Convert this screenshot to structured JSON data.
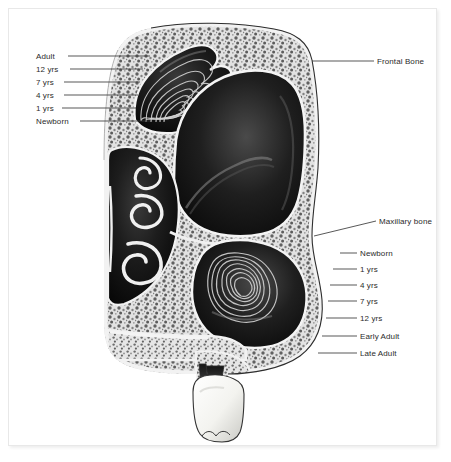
{
  "figure": {
    "background_color": "#ffffff",
    "frame_color": "#e8e8e8",
    "label_color": "#2b2b2b",
    "leader_line_color": "#3a3a3a",
    "bone_color": "#d9d9d9",
    "cavity_color": "#141414",
    "tooth_color": "#f5f5f2",
    "contour_color": "#cfcfcf"
  },
  "labels": {
    "left_group": {
      "name": "frontal-sinus-growth-stages",
      "items": [
        {
          "text": "Adult",
          "x": 36,
          "y": 52,
          "line_x1": 68,
          "line_x2": 150,
          "line_y": 56
        },
        {
          "text": "12 yrs",
          "x": 36,
          "y": 65,
          "line_x1": 70,
          "line_x2": 143,
          "line_y": 69
        },
        {
          "text": "7 yrs",
          "x": 36,
          "y": 78,
          "line_x1": 64,
          "line_x2": 140,
          "line_y": 82
        },
        {
          "text": "4 yrs",
          "x": 36,
          "y": 91,
          "line_x1": 64,
          "line_x2": 138,
          "line_y": 95
        },
        {
          "text": "1 yrs",
          "x": 36,
          "y": 104,
          "line_x1": 62,
          "line_x2": 136,
          "line_y": 108
        },
        {
          "text": "Newborn",
          "x": 36,
          "y": 117,
          "line_x1": 80,
          "line_x2": 150,
          "line_y": 121
        }
      ]
    },
    "right_group": {
      "name": "maxillary-sinus-growth-stages",
      "items": [
        {
          "text": "Newborn",
          "x": 360,
          "y": 249,
          "line_x1": 340,
          "line_x2": 357,
          "line_y": 253
        },
        {
          "text": "1 yrs",
          "x": 360,
          "y": 265,
          "line_x1": 333,
          "line_x2": 357,
          "line_y": 269
        },
        {
          "text": "4 yrs",
          "x": 360,
          "y": 281,
          "line_x1": 330,
          "line_x2": 357,
          "line_y": 285
        },
        {
          "text": "7 yrs",
          "x": 360,
          "y": 297,
          "line_x1": 328,
          "line_x2": 357,
          "line_y": 301
        },
        {
          "text": "12 yrs",
          "x": 360,
          "y": 314,
          "line_x1": 326,
          "line_x2": 357,
          "line_y": 318
        },
        {
          "text": "Early Adult",
          "x": 360,
          "y": 332,
          "line_x1": 322,
          "line_x2": 357,
          "line_y": 336
        },
        {
          "text": "Late Adult",
          "x": 360,
          "y": 349,
          "line_x1": 318,
          "line_x2": 357,
          "line_y": 353
        }
      ]
    },
    "bone_callouts": [
      {
        "name": "frontal-bone",
        "text": "Frontal Bone",
        "x": 377,
        "y": 57,
        "line_x1": 312,
        "line_y1": 61,
        "line_x2": 374,
        "line_y2": 61
      },
      {
        "name": "maxillary-bone",
        "text": "Maxillary bone",
        "x": 379,
        "y": 217,
        "line_x1": 314,
        "line_y1": 236,
        "line_x2": 376,
        "line_y2": 221
      }
    ]
  },
  "anatomy": {
    "regions": [
      {
        "name": "frontal-sinus",
        "description": "frontal sinus cavity with six nested growth contours"
      },
      {
        "name": "cranial-cavity",
        "description": "large dark cavity below frontal bone"
      },
      {
        "name": "nasal-turbinates",
        "description": "scroll-shaped conchae in nasal cavity"
      },
      {
        "name": "maxillary-sinus",
        "description": "maxillary sinus with seven nested growth contours"
      },
      {
        "name": "hard-palate",
        "description": "horizontal palatine bone shelf"
      },
      {
        "name": "molar-tooth",
        "description": "white two-rooted molar below alveolar ridge"
      }
    ]
  }
}
